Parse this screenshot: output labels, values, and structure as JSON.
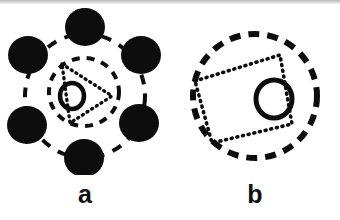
{
  "figure": {
    "width": 340,
    "height": 220,
    "background_color": "#ffffff",
    "ink_color": "#0d0d0d",
    "top_band_color": "#c4c4c4"
  },
  "panels": [
    {
      "id": "a",
      "label": "a",
      "description": "Six filled black disks arranged on a large dashed ring, with a smaller dashed ring and a dotted rounded-triangle inside, and one small open circle near the centre",
      "outer_dashed_ring": {
        "shape": "circle",
        "center_x": 85,
        "center_y": 96,
        "radius_x": 60,
        "radius_y": 62,
        "stroke_width": 4,
        "dash": "10 9",
        "style": "dashed"
      },
      "inner_dashed_ring": {
        "shape": "circle",
        "center_x": 84,
        "center_y": 92,
        "radius_x": 35,
        "radius_y": 34,
        "stroke_width": 4,
        "dash": "8 7",
        "style": "dashed"
      },
      "dotted_shape": {
        "shape": "rounded-triangle",
        "points": "62,64 112,96 70,123",
        "stroke_width": 3.4,
        "dash": "1 4.5",
        "style": "dotted"
      },
      "open_circle": {
        "center_x": 72,
        "center_y": 96,
        "radius_x": 12,
        "radius_y": 13,
        "stroke_width": 4.5,
        "fill": "none"
      },
      "filled_disks": [
        {
          "name": "disk-top",
          "center_x": 85,
          "center_y": 27,
          "radius_x": 20,
          "radius_y": 19
        },
        {
          "name": "disk-upper-left",
          "center_x": 28,
          "center_y": 55,
          "radius_x": 20,
          "radius_y": 19
        },
        {
          "name": "disk-upper-right",
          "center_x": 141,
          "center_y": 55,
          "radius_x": 20,
          "radius_y": 19
        },
        {
          "name": "disk-lower-left",
          "center_x": 27,
          "center_y": 125,
          "radius_x": 20,
          "radius_y": 19
        },
        {
          "name": "disk-lower-right",
          "center_x": 139,
          "center_y": 123,
          "radius_x": 20,
          "radius_y": 19
        },
        {
          "name": "disk-bottom",
          "center_x": 84,
          "center_y": 158,
          "radius_x": 20,
          "radius_y": 19
        }
      ],
      "disk_count": 6
    },
    {
      "id": "b",
      "label": "b",
      "description": "A single large dashed ring enclosing a dotted tilted rectangle and one small open circle offset to the right of centre",
      "outer_dashed_ring": {
        "shape": "circle",
        "center_x": 85,
        "center_y": 96,
        "radius_x": 62,
        "radius_y": 62,
        "stroke_width": 6,
        "dash": "11 8",
        "style": "dashed"
      },
      "dotted_shape": {
        "shape": "tilted-rectangle",
        "points": "25,81 110,55 122,124 42,143",
        "stroke_width": 3.6,
        "dash": "1 4.8",
        "style": "dotted"
      },
      "open_circle": {
        "center_x": 104,
        "center_y": 99,
        "radius_x": 18,
        "radius_y": 19,
        "stroke_width": 5,
        "fill": "none"
      },
      "disk_count": 0
    }
  ]
}
